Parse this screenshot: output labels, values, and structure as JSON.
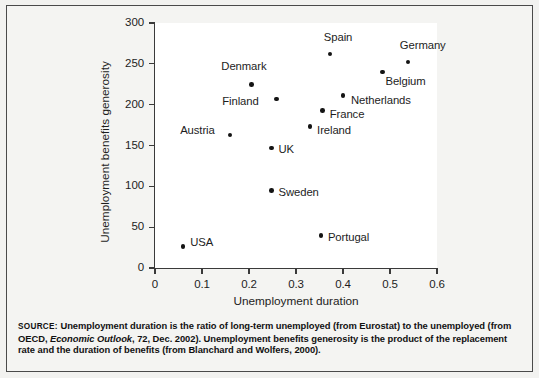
{
  "figure": {
    "background_color": "#f2f2f0",
    "panel_color": "#ffffff",
    "border_color": "#4a4a4a",
    "marker_color": "#141414"
  },
  "source": {
    "keyword": "SOURCE:",
    "text_part1": " Unemployment duration is the ratio of long-term unemployed (from Eurostat) to the unemployed (from OECD, ",
    "italic_part": "Economic Outlook",
    "text_part2": ", 72, Dec. 2002). Unemployment benefits generosity is the product of the replacement rate and the duration of benefits (from Blanchard and Wolfers, 2000)."
  },
  "chart_data": {
    "type": "scatter",
    "title": "",
    "xlabel": "Unemployment duration",
    "ylabel": "Unemployment benefits generosity",
    "xlim": [
      0,
      0.6
    ],
    "ylim": [
      0,
      300
    ],
    "xticks": [
      "0",
      "0.1",
      "0.2",
      "0.3",
      "0.4",
      "0.5",
      "0.6"
    ],
    "xtick_values": [
      0,
      0.1,
      0.2,
      0.3,
      0.4,
      0.5,
      0.6
    ],
    "yticks": [
      "0",
      "50",
      "100",
      "150",
      "200",
      "250",
      "300"
    ],
    "ytick_values": [
      0,
      50,
      100,
      150,
      200,
      250,
      300
    ],
    "grid": false,
    "legend": "none",
    "points": [
      {
        "label": "USA",
        "x": 0.06,
        "y": 26,
        "label_dx": 7,
        "label_dy": -5
      },
      {
        "label": "Austria",
        "x": 0.16,
        "y": 163,
        "label_dx": -50,
        "label_dy": -5
      },
      {
        "label": "Denmark",
        "x": 0.205,
        "y": 225,
        "label_dx": -30,
        "label_dy": -18
      },
      {
        "label": "Finland",
        "x": 0.258,
        "y": 207,
        "label_dx": -54,
        "label_dy": 2
      },
      {
        "label": "Sweden",
        "x": 0.248,
        "y": 95,
        "label_dx": 7,
        "label_dy": 2
      },
      {
        "label": "UK",
        "x": 0.248,
        "y": 147,
        "label_dx": 7,
        "label_dy": 1
      },
      {
        "label": "Ireland",
        "x": 0.33,
        "y": 173,
        "label_dx": 7,
        "label_dy": 3
      },
      {
        "label": "Portugal",
        "x": 0.353,
        "y": 40,
        "label_dx": 7,
        "label_dy": 2
      },
      {
        "label": "France",
        "x": 0.357,
        "y": 193,
        "label_dx": 7,
        "label_dy": 4
      },
      {
        "label": "Spain",
        "x": 0.372,
        "y": 262,
        "label_dx": -6,
        "label_dy": -17
      },
      {
        "label": "Netherlands",
        "x": 0.4,
        "y": 211,
        "label_dx": 8,
        "label_dy": 4
      },
      {
        "label": "Belgium",
        "x": 0.484,
        "y": 240,
        "label_dx": 3,
        "label_dy": 9
      },
      {
        "label": "Germany",
        "x": 0.538,
        "y": 252,
        "label_dx": -8,
        "label_dy": -17
      }
    ]
  }
}
